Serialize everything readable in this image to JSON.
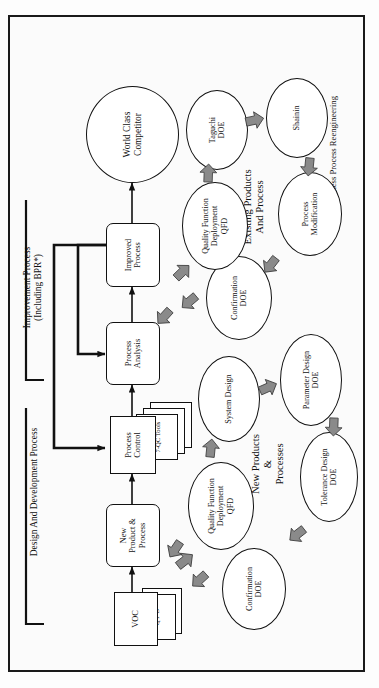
{
  "figure": {
    "orientation": "rotated-90-ccw",
    "frame_border_color": "#1a1a1a",
    "background_color": "#fbfbfb"
  },
  "main_chain": {
    "boxes": [
      {
        "id": "voc",
        "label": "VOC",
        "type": "document-stack"
      },
      {
        "id": "new_product_process",
        "label": "New\nProduct &\nProcess",
        "type": "rounded-box"
      },
      {
        "id": "process_control",
        "label": "Process\nControl",
        "type": "document-stack"
      },
      {
        "id": "process_analysis",
        "label": "Process\nAnalysis",
        "type": "rounded-box"
      },
      {
        "id": "improved_process",
        "label": "Improved\nProcess",
        "type": "rounded-box"
      }
    ],
    "goal": {
      "id": "world_class_competitor",
      "label": "World Class\nCompetitor"
    }
  },
  "doc_stacks": {
    "voc_sheets": [
      "Q F D",
      "7-MP Tools"
    ],
    "process_control_sheets": [
      "7-QC Tools",
      "SPC Charts",
      "Cp / Cpk"
    ]
  },
  "phase_labels": {
    "design": "Design And Development Process",
    "improvement": "Improvement Process\n(Including BPR*)"
  },
  "groups": [
    {
      "id": "new_products_processes",
      "title": "New Products\n&\nProcesses",
      "nodes": [
        {
          "id": "qfd_new",
          "label": "Quality Function\nDeployment\nQFD"
        },
        {
          "id": "system_design",
          "label": "System Design"
        },
        {
          "id": "parameter_design_doe",
          "label": "Parameter Design\nDOE"
        },
        {
          "id": "tolerance_design_doe",
          "label": "Tolerance Design\nDOE"
        },
        {
          "id": "confirmation_doe_new",
          "label": "Confirmation\nDOE"
        }
      ]
    },
    {
      "id": "existing_products_process",
      "title": "Existing Products\nAnd Process",
      "nodes": [
        {
          "id": "qfd_existing",
          "label": "Quality Function\nDeployment\nQFD"
        },
        {
          "id": "taguchi_doe",
          "label": "Taguchi\nDOE"
        },
        {
          "id": "shainin",
          "label": "Shainin"
        },
        {
          "id": "process_modification",
          "label": "Process\nModification"
        },
        {
          "id": "confirmation_doe_existing",
          "label": "Confirmation\nDOE"
        }
      ]
    }
  ],
  "footnote": "*   Business Process Reengineering",
  "colors": {
    "line": "#111111",
    "arrow_fill": "#8a8a8a",
    "arrow_stroke": "#333333",
    "node_fill": "#ffffff"
  }
}
